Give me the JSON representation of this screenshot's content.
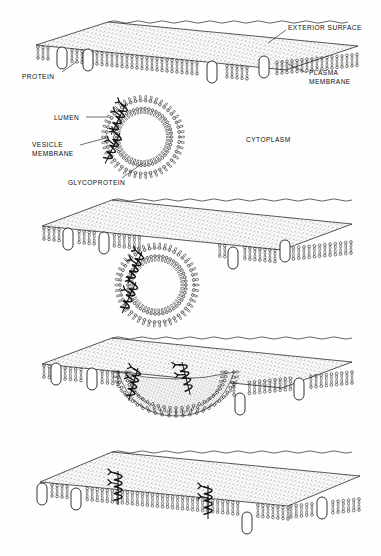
{
  "figure": {
    "ink_color": "#111111",
    "paper_color": "#fefefe",
    "panel_count": 4,
    "labels": [
      {
        "id": "exterior-surface",
        "text": "EXTERIOR SURFACE",
        "x": 288,
        "y": 24,
        "align": "left",
        "leader": {
          "x1": 286,
          "y1": 30,
          "x2": 268,
          "y2": 43
        }
      },
      {
        "id": "protein",
        "text": "PROTEIN",
        "x": 22,
        "y": 73,
        "align": "left",
        "leader": {
          "x1": 62,
          "y1": 72,
          "x2": 76,
          "y2": 62
        }
      },
      {
        "id": "plasma-membrane",
        "text": "PLASMA\nMEMBRANE",
        "x": 309,
        "y": 69,
        "align": "left",
        "leader": {
          "x1": 307,
          "y1": 73,
          "x2": 288,
          "y2": 64
        }
      },
      {
        "id": "lumen",
        "text": "LUMEN",
        "x": 54,
        "y": 114,
        "align": "left",
        "leader": {
          "x1": 86,
          "y1": 117,
          "x2": 108,
          "y2": 117
        }
      },
      {
        "id": "vesicle-membrane",
        "text": "VESICLE\nMEMBRANE",
        "x": 32,
        "y": 141,
        "align": "left",
        "leader": {
          "x1": 80,
          "y1": 145,
          "x2": 106,
          "y2": 138
        }
      },
      {
        "id": "glycoprotein",
        "text": "GLYCOPROTEIN",
        "x": 68,
        "y": 179,
        "align": "left",
        "leader": {
          "x1": 122,
          "y1": 178,
          "x2": 143,
          "y2": 163
        }
      },
      {
        "id": "cytoplasm",
        "text": "CYTOPLASM",
        "x": 246,
        "y": 136,
        "align": "left",
        "leader": null
      }
    ],
    "panels": [
      {
        "id": "panel-1-docking-approach",
        "stage": "Vesicle with glycoproteins approaches the plasma membrane",
        "membrane_y": 40,
        "vesicle": true
      },
      {
        "id": "panel-2-contact",
        "stage": "Vesicle membrane contacts and dimples the plasma membrane",
        "membrane_y": 215,
        "vesicle": true
      },
      {
        "id": "panel-3-fusion",
        "stage": "Membranes fuse; lumen opens to the exterior surface",
        "membrane_y": 350,
        "vesicle": true
      },
      {
        "id": "panel-4-integrated",
        "stage": "Glycoproteins integrated into the plasma membrane",
        "membrane_y": 460,
        "vesicle": false
      }
    ]
  }
}
